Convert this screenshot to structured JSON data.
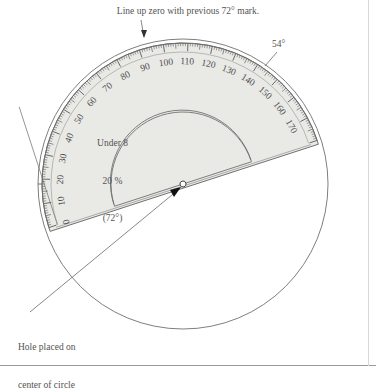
{
  "figure": {
    "type": "diagram",
    "caption_top": "Line up zero with previous 72° mark.",
    "angle_callout": "54°",
    "hole_note_line1": "Hole placed on",
    "hole_note_line2": "center of circle",
    "sector_label_line1": "Under 8",
    "sector_label_line2": "20 %",
    "sector_label_line3": "(72°)"
  },
  "chart_data": {
    "type": "pie",
    "title": "Line up zero with previous 72° mark.",
    "categories": [
      "Under 8"
    ],
    "values": [
      20
    ],
    "value_unit": "%",
    "angles_deg": [
      72
    ],
    "annotations": [
      "54°",
      "Hole placed on center of circle"
    ]
  },
  "protractor": {
    "scale_start": 0,
    "scale_end": 180,
    "major_step": 10,
    "rotation_deg": -18,
    "labels": [
      "0",
      "10",
      "20",
      "30",
      "40",
      "50",
      "60",
      "70",
      "80",
      "90",
      "100",
      "110",
      "120",
      "130",
      "140",
      "150",
      "160",
      "170"
    ],
    "fill_color": "#e9e9e6",
    "edge_color": "#6f6f6f",
    "tick_color": "#58585a"
  },
  "colors": {
    "ink": "#555350",
    "line": "#6a6a6a",
    "frame": "#9a9a9a",
    "accent": "#000000"
  },
  "geometry": {
    "center_x": 183,
    "center_y": 184,
    "circle_radius": 145,
    "protractor_radius": 141,
    "inner_radius": 72
  }
}
